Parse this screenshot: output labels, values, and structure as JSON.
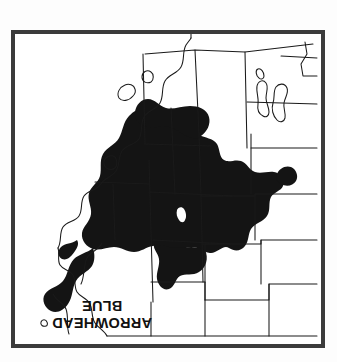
{
  "figure": {
    "background_color": "#fdfdfd",
    "orientation_note": "plate printed upside-down (rotated 180 degrees)"
  },
  "plate": {
    "frame_color": "#3b3b3b",
    "frame_thickness_px": 4,
    "fill_color": "#ffffff"
  },
  "title": {
    "line_1": "ARROWHEAD",
    "line_2": "BLUE",
    "color": "#111111"
  },
  "map": {
    "type": "range-map",
    "region": "Western United States",
    "outline_color": "#1a1a1a",
    "range_fill_color": "#141414",
    "range_label": "distribution range",
    "features": [
      "state-boundaries",
      "pacific-coastline",
      "great-salt-lake",
      "range-shading"
    ]
  }
}
